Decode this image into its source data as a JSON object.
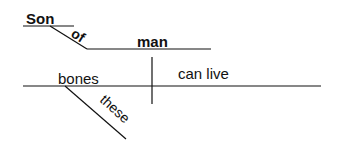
{
  "diagram": {
    "type": "sentence-diagram",
    "words": {
      "subject_modifier_head": "Son",
      "preposition": "of",
      "object_of_preposition": "man",
      "subject": "bones",
      "predicate": "can live",
      "subject_modifier": "these"
    },
    "colors": {
      "ink": "#111111",
      "background": "#ffffff"
    }
  }
}
